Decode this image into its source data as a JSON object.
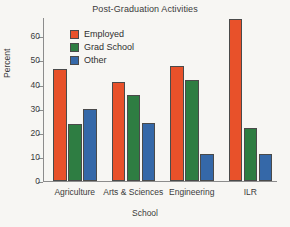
{
  "chart_data": {
    "type": "bar",
    "title": "Post-Graduation Activities",
    "xlabel": "School",
    "ylabel": "Percent",
    "categories": [
      "Agriculture",
      "Arts & Sciences",
      "Engineering",
      "ILR"
    ],
    "series": [
      {
        "name": "Employed",
        "color": "#E8512A",
        "values": [
          46.5,
          41,
          47.5,
          67
        ]
      },
      {
        "name": "Grad School",
        "color": "#2E7D42",
        "values": [
          23.5,
          35.5,
          42,
          22
        ]
      },
      {
        "name": "Other",
        "color": "#3568A8",
        "values": [
          30,
          24,
          11,
          11
        ]
      }
    ],
    "ylim": [
      0,
      68
    ],
    "yticks": [
      0,
      10,
      20,
      30,
      40,
      50,
      60
    ],
    "ytick_labels": [
      "0",
      "10",
      "20",
      "30",
      "40",
      "50",
      "60"
    ],
    "grid": false,
    "legend_position": "upper-left-inside"
  },
  "legend": {
    "entries": [
      {
        "label": "Employed",
        "color": "#E8512A"
      },
      {
        "label": "Grad School",
        "color": "#2E7D42"
      },
      {
        "label": "Other",
        "color": "#3568A8"
      }
    ]
  },
  "colors": {
    "employed": "#E8512A",
    "grad_school": "#2E7D42",
    "other": "#3568A8",
    "axis": "#8c8c8c",
    "text": "#3b3b3b",
    "background": "#f7f6f3"
  }
}
